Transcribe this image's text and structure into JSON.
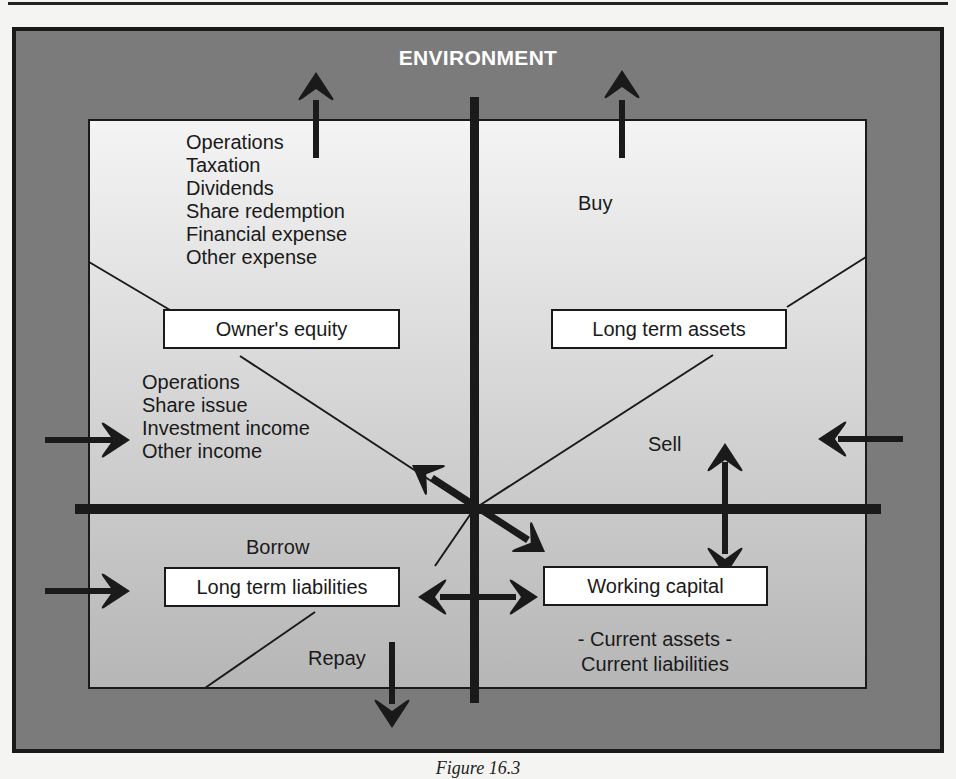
{
  "title": "ENVIRONMENT",
  "caption": "Figure 16.3",
  "colors": {
    "outer_frame": "#7a7a7a",
    "inner_panel_top": "#f3f3f3",
    "inner_panel_bottom": "#b9b9b9",
    "ink": "#1a1a1a",
    "title_text": "#ffffff"
  },
  "quadrants": {
    "top_left": {
      "outflows": [
        "Operations",
        "Taxation",
        "Dividends",
        "Share redemption",
        "Financial expense",
        "Other expense"
      ],
      "box": "Owner's equity",
      "inflows": [
        "Operations",
        "Share issue",
        "Investment income",
        "Other income"
      ]
    },
    "top_right": {
      "outflow_label": "Buy",
      "box": "Long term assets",
      "inflow_label": "Sell"
    },
    "bottom_left": {
      "inflow_label": "Borrow",
      "box": "Long term liabilities",
      "outflow_label": "Repay"
    },
    "bottom_right": {
      "box": "Working capital",
      "definition": [
        "- Current assets -",
        "Current liabilities"
      ]
    }
  },
  "arrows": [
    {
      "name": "equity-outflow",
      "direction": "up",
      "from": "Owner's equity",
      "to": "Environment"
    },
    {
      "name": "assets-buy",
      "direction": "up",
      "from": "Long term assets",
      "to": "Environment"
    },
    {
      "name": "equity-inflow",
      "direction": "right",
      "from": "Environment",
      "to": "Owner's equity"
    },
    {
      "name": "assets-sell",
      "direction": "left",
      "from": "Environment",
      "to": "Long term assets"
    },
    {
      "name": "liabilities-borrow",
      "direction": "right",
      "from": "Environment",
      "to": "Long term liabilities"
    },
    {
      "name": "liabilities-repay",
      "direction": "down",
      "from": "Long term liabilities",
      "to": "Environment"
    },
    {
      "name": "equity-working-capital",
      "direction": "diagonal-bidirectional"
    },
    {
      "name": "assets-working-capital",
      "direction": "vertical-bidirectional"
    },
    {
      "name": "liabilities-working-capital",
      "direction": "horizontal-bidirectional"
    }
  ]
}
